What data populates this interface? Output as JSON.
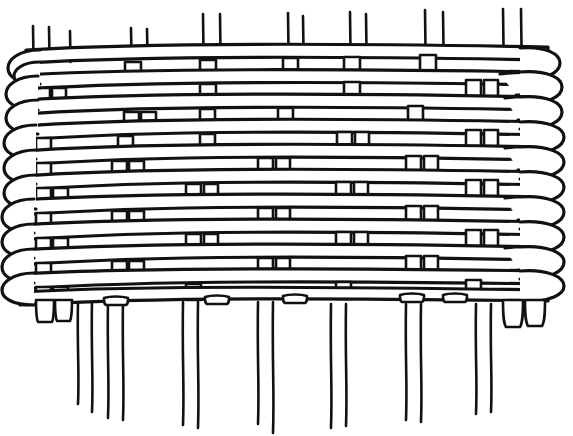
{
  "document": {
    "title": "Plain Weave Basketry Diagram",
    "kind": "line-drawing",
    "background_color": "#ffffff",
    "ink_color": "#111111",
    "canvas": {
      "width": 573,
      "height": 436
    }
  },
  "figure": {
    "name": "woven-fabric-diagram",
    "style": {
      "stroke_color": "#111111",
      "fill_color": "#ffffff",
      "shadow_color": "#111111",
      "line_weight_weft": 3.2,
      "line_weight_warp": 2.6
    },
    "woven_field": {
      "top": 46,
      "bottom": 302,
      "left": 14,
      "right": 556
    },
    "weft_rows": [
      {
        "index": 1,
        "y": 56,
        "label": "weft-row-1"
      },
      {
        "index": 2,
        "y": 81,
        "label": "weft-row-2"
      },
      {
        "index": 3,
        "y": 105,
        "label": "weft-row-3"
      },
      {
        "index": 4,
        "y": 130,
        "label": "weft-row-4"
      },
      {
        "index": 5,
        "y": 154,
        "label": "weft-row-5"
      },
      {
        "index": 6,
        "y": 179,
        "label": "weft-row-6"
      },
      {
        "index": 7,
        "y": 203,
        "label": "weft-row-7"
      },
      {
        "index": 8,
        "y": 228,
        "label": "weft-row-8"
      },
      {
        "index": 9,
        "y": 252,
        "label": "weft-row-9"
      },
      {
        "index": 10,
        "y": 277,
        "label": "weft-row-10"
      },
      {
        "index": 11,
        "y": 297,
        "label": "weft-row-11"
      }
    ],
    "warp_columns_top": [
      {
        "index": 1,
        "x": 33,
        "y_top": 26,
        "y_bottom": 60
      },
      {
        "index": 2,
        "x": 49,
        "y_top": 27,
        "y_bottom": 58
      },
      {
        "index": 3,
        "x": 70,
        "y_top": 31,
        "y_bottom": 62
      },
      {
        "index": 4,
        "x": 131,
        "y_top": 28,
        "y_bottom": 56
      },
      {
        "index": 5,
        "x": 147,
        "y_top": 29,
        "y_bottom": 56
      },
      {
        "index": 6,
        "x": 203,
        "y_top": 14,
        "y_bottom": 52
      },
      {
        "index": 7,
        "x": 220,
        "y_top": 14,
        "y_bottom": 52
      },
      {
        "index": 8,
        "x": 288,
        "y_top": 13,
        "y_bottom": 50
      },
      {
        "index": 9,
        "x": 303,
        "y_top": 16,
        "y_bottom": 50
      },
      {
        "index": 10,
        "x": 350,
        "y_top": 12,
        "y_bottom": 50
      },
      {
        "index": 11,
        "x": 366,
        "y_top": 14,
        "y_bottom": 50
      },
      {
        "index": 12,
        "x": 425,
        "y_top": 10,
        "y_bottom": 48
      },
      {
        "index": 13,
        "x": 443,
        "y_top": 12,
        "y_bottom": 48
      },
      {
        "index": 14,
        "x": 503,
        "y_top": 9,
        "y_bottom": 46
      },
      {
        "index": 15,
        "x": 521,
        "y_top": 9,
        "y_bottom": 46
      }
    ],
    "warp_columns_bottom": [
      {
        "index": 1,
        "x": 78,
        "y_top": 300,
        "y_bottom": 404
      },
      {
        "index": 2,
        "x": 92,
        "y_top": 300,
        "y_bottom": 412
      },
      {
        "index": 3,
        "x": 108,
        "y_top": 300,
        "y_bottom": 418
      },
      {
        "index": 4,
        "x": 123,
        "y_top": 300,
        "y_bottom": 420
      },
      {
        "index": 5,
        "x": 183,
        "y_top": 302,
        "y_bottom": 425
      },
      {
        "index": 6,
        "x": 198,
        "y_top": 302,
        "y_bottom": 428
      },
      {
        "index": 7,
        "x": 258,
        "y_top": 302,
        "y_bottom": 424
      },
      {
        "index": 8,
        "x": 273,
        "y_top": 302,
        "y_bottom": 433
      },
      {
        "index": 9,
        "x": 331,
        "y_top": 304,
        "y_bottom": 428
      },
      {
        "index": 10,
        "x": 346,
        "y_top": 304,
        "y_bottom": 426
      },
      {
        "index": 11,
        "x": 406,
        "y_top": 304,
        "y_bottom": 420
      },
      {
        "index": 12,
        "x": 421,
        "y_top": 304,
        "y_bottom": 422
      },
      {
        "index": 13,
        "x": 476,
        "y_top": 304,
        "y_bottom": 414
      },
      {
        "index": 14,
        "x": 491,
        "y_top": 304,
        "y_bottom": 412
      }
    ],
    "warp_tab_columns": [
      76,
      132,
      207,
      265,
      285,
      345,
      411,
      470,
      520
    ],
    "selvedge_left": {
      "label": "left-selvedge-loops",
      "x_center": 30,
      "loop_count": 10,
      "description": "Weft strands turn back in stacked open loops along the left edge"
    },
    "selvedge_right": {
      "label": "right-selvedge-loops",
      "x_center": 530,
      "loop_count": 10,
      "description": "Weft strands turn back in stacked open loops along the right edge"
    }
  }
}
